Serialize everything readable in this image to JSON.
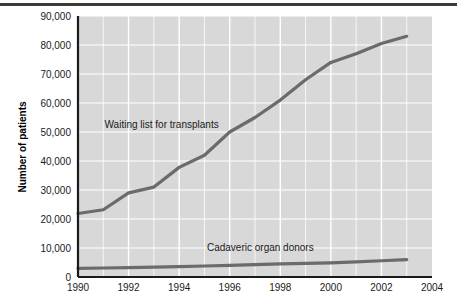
{
  "figure": {
    "top_rule_color": "#3b3b3b",
    "plot_bg_color": "#d8d8d8",
    "gridline_color": "#ffffff",
    "axis_color": "#1a1a1a",
    "series_color": "#6b6b6b"
  },
  "chart_data": {
    "type": "line",
    "title": "",
    "xlabel": "",
    "ylabel": "Number of patients",
    "xlim": [
      1990,
      2004
    ],
    "ylim": [
      0,
      90000
    ],
    "xticks": [
      "1990",
      "1992",
      "1994",
      "1996",
      "1998",
      "2000",
      "2002",
      "2004"
    ],
    "xtick_values": [
      1990,
      1992,
      1994,
      1996,
      1998,
      2000,
      2002,
      2004
    ],
    "yticks": [
      "0",
      "10,000",
      "20,000",
      "30,000",
      "40,000",
      "50,000",
      "60,000",
      "70,000",
      "80,000",
      "90,000"
    ],
    "ytick_values": [
      0,
      10000,
      20000,
      30000,
      40000,
      50000,
      60000,
      70000,
      80000,
      90000
    ],
    "grid": true,
    "legend_position": "inline-annotation",
    "x": [
      1990,
      1991,
      1992,
      1993,
      1994,
      1995,
      1996,
      1997,
      1998,
      1999,
      2000,
      2001,
      2002,
      2003
    ],
    "series": [
      {
        "name": "Waiting list for transplants",
        "label_x": 1991.05,
        "label_y": 51500,
        "values": [
          21900,
          23200,
          29000,
          31000,
          37800,
          42000,
          50000,
          55000,
          61000,
          68000,
          74000,
          77000,
          80500,
          83000
        ]
      },
      {
        "name": "Cadaveric organ donors",
        "label_x": 1995.1,
        "label_y": 9000,
        "values": [
          3000,
          3100,
          3200,
          3400,
          3600,
          3800,
          4000,
          4250,
          4500,
          4700,
          4900,
          5200,
          5600,
          6000
        ]
      }
    ]
  }
}
